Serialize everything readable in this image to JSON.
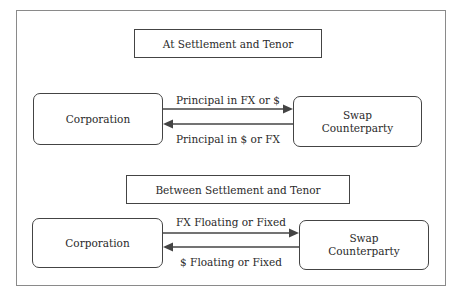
{
  "sections": [
    {
      "title": "At Settlement and Tenor",
      "left_node": "Corporation",
      "right_node": "Swap Counterparty",
      "right_node_lines": [
        "Swap",
        "Counterparty"
      ],
      "top_arrow_label": "Principal in FX or $",
      "top_arrow_direction": "to-right",
      "bottom_arrow_label": "Principal in $ or FX",
      "bottom_arrow_direction": "to-left"
    },
    {
      "title": "Between Settlement and Tenor",
      "left_node": "Corporation",
      "right_node": "Swap Counterparty",
      "right_node_lines": [
        "Swap",
        "Counterparty"
      ],
      "top_arrow_label": "FX Floating or Fixed",
      "top_arrow_direction": "to-right",
      "bottom_arrow_label": "$ Floating or Fixed",
      "bottom_arrow_direction": "to-left"
    }
  ],
  "colors": {
    "line": "#444444",
    "frame": "#8a8a8a",
    "text": "#2a2a2a"
  }
}
